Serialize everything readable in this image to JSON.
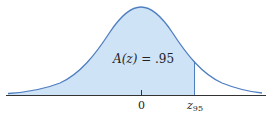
{
  "diagram": {
    "area_label": {
      "prefix": "A(z) = ",
      "value": ".95"
    },
    "axis_labels": {
      "zero": "0",
      "z_symbol": "z",
      "z_subscript": "95"
    },
    "colors": {
      "fill": "#cfe3f7",
      "curve": "#4f7fc0",
      "axis": "#333333"
    },
    "shaded_region": "left tail up to z.95",
    "area_value": 0.95
  }
}
